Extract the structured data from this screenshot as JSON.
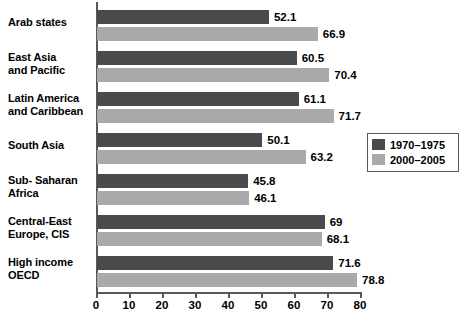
{
  "chart_data": {
    "type": "bar",
    "orientation": "horizontal",
    "title": "",
    "xlabel": "",
    "ylabel": "",
    "xlim": [
      0,
      80
    ],
    "x_ticks": [
      0,
      10,
      20,
      30,
      40,
      50,
      60,
      70,
      80
    ],
    "grid": false,
    "legend_position": "right-middle",
    "categories": [
      "Arab states",
      "East Asia\nand Pacific",
      "Latin America\nand Caribbean",
      "South Asia",
      "Sub- Saharan\nAfrica",
      "Central-East\nEurope, CIS",
      "High income\nOECD"
    ],
    "series": [
      {
        "name": "1970–1975",
        "color": "#4b4b4d",
        "values": [
          52.1,
          60.5,
          61.1,
          50.1,
          45.8,
          69,
          71.6
        ],
        "value_labels": [
          "52.1",
          "60.5",
          "61.1",
          "50.1",
          "45.8",
          "69",
          "71.6"
        ]
      },
      {
        "name": "2000–2005",
        "color": "#a9a9ab",
        "values": [
          66.9,
          70.4,
          71.7,
          63.2,
          46.1,
          68.1,
          78.8
        ],
        "value_labels": [
          "66.9",
          "70.4",
          "71.7",
          "63.2",
          "46.1",
          "68.1",
          "78.8"
        ]
      }
    ]
  },
  "legend": {
    "entries": [
      {
        "label": "1970–1975",
        "color": "#4b4b4d"
      },
      {
        "label": "2000–2005",
        "color": "#a9a9ab"
      }
    ]
  },
  "axis": {
    "tick_labels": [
      "0",
      "10",
      "20",
      "30",
      "40",
      "50",
      "60",
      "70",
      "80"
    ]
  },
  "colors": {
    "series_1970_1975": "#4b4b4d",
    "series_2000_2005": "#a9a9ab",
    "axis": "#59595b",
    "text": "#000000",
    "background": "#ffffff"
  }
}
